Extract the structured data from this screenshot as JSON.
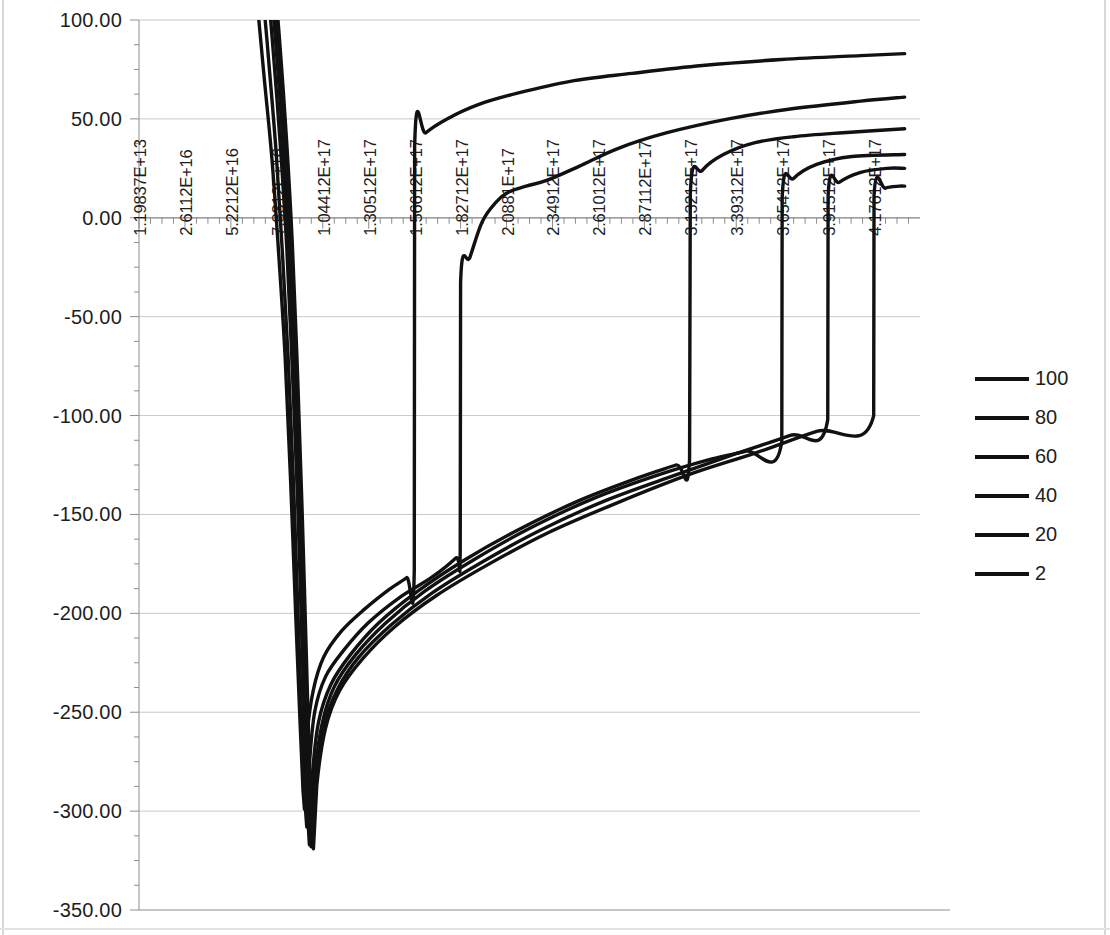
{
  "chart_data": {
    "type": "line",
    "title": "",
    "subtitle": "",
    "xlabel": "",
    "ylabel": "",
    "grid": true,
    "legend_position": "right",
    "ylim": [
      -350,
      100
    ],
    "y_ticks": [
      "100.00",
      "50.00",
      "0.00",
      "-50.00",
      "-100.00",
      "-150.00",
      "-200.00",
      "-250.00",
      "-300.00",
      "-350.00"
    ],
    "y_tick_values": [
      100,
      50,
      0,
      -50,
      -100,
      -150,
      -200,
      -250,
      -300,
      -350
    ],
    "x_tick_labels": [
      "1.19837E+13",
      "2.6112E+16",
      "5.2212E+16",
      "7.8312E+16",
      "1.04412E+17",
      "1.30512E+17",
      "1.56612E+17",
      "1.82712E+17",
      "2.0881E+17",
      "2.34912E+17",
      "2.61012E+17",
      "2.87112E+17",
      "3.13212E+17",
      "3.39312E+17",
      "3.65412E+17",
      "3.91512E+17",
      "4.17612E+17"
    ],
    "x_tick_values": [
      11983700000000.0,
      2.6112e+16,
      5.2212e+16,
      7.8312e+16,
      1.04412e+17,
      1.30512e+17,
      1.56612e+17,
      1.82712e+17,
      2.0881e+17,
      2.34912e+17,
      2.61012e+17,
      2.87112e+17,
      3.13212e+17,
      3.39312e+17,
      3.65412e+17,
      3.91512e+17,
      4.17612e+17
    ],
    "xlim": [
      0,
      4.4371e+17
    ],
    "minor_ticks_per_interval": 3,
    "series_color": "#111111",
    "legend": [
      {
        "label": "100"
      },
      {
        "label": "80"
      },
      {
        "label": "60"
      },
      {
        "label": "40"
      },
      {
        "label": "20"
      },
      {
        "label": "2"
      }
    ],
    "series": [
      {
        "name": "100",
        "points": [
          [
            5.8e+16,
            190
          ],
          [
            6.6e+16,
            120
          ],
          [
            7.1e+16,
            72
          ],
          [
            7.55e+16,
            30
          ],
          [
            7.95e+16,
            -20
          ],
          [
            8.3e+16,
            -70
          ],
          [
            8.6e+16,
            -130
          ],
          [
            8.9e+16,
            -200
          ],
          [
            9.15e+16,
            -255
          ],
          [
            9.32e+16,
            -290
          ],
          [
            9.4e+16,
            -299
          ],
          [
            9.55e+16,
            -262
          ],
          [
            9.9e+16,
            -239
          ],
          [
            1.05e+17,
            -222
          ],
          [
            1.15e+17,
            -209
          ],
          [
            1.28e+17,
            -198
          ],
          [
            1.42e+17,
            -188
          ],
          [
            1.52e+17,
            -182
          ],
          [
            1.564e+17,
            -178
          ],
          [
            1.566e+17,
            36
          ],
          [
            1.63e+17,
            43
          ],
          [
            1.75e+17,
            50
          ],
          [
            1.92e+17,
            57
          ],
          [
            2.15e+17,
            63
          ],
          [
            2.45e+17,
            69
          ],
          [
            2.8e+17,
            73
          ],
          [
            3.2e+17,
            77
          ],
          [
            3.65e+17,
            80
          ],
          [
            4.1e+17,
            82
          ],
          [
            4.35e+17,
            83
          ]
        ]
      },
      {
        "name": "80",
        "points": [
          [
            6.2e+16,
            190
          ],
          [
            6.95e+16,
            122
          ],
          [
            7.4e+16,
            76
          ],
          [
            7.8e+16,
            32
          ],
          [
            8.15e+16,
            -18
          ],
          [
            8.48e+16,
            -72
          ],
          [
            8.78e+16,
            -135
          ],
          [
            9.05e+16,
            -205
          ],
          [
            9.28e+16,
            -262
          ],
          [
            9.45e+16,
            -298
          ],
          [
            9.53e+16,
            -308
          ],
          [
            9.7e+16,
            -274
          ],
          [
            1e+17,
            -249
          ],
          [
            1.06e+17,
            -232
          ],
          [
            1.16e+17,
            -219
          ],
          [
            1.3e+17,
            -205
          ],
          [
            1.48e+17,
            -192
          ],
          [
            1.66e+17,
            -182
          ],
          [
            1.8e+17,
            -172
          ],
          [
            1.825e+17,
            -168
          ],
          [
            1.827e+17,
            -33
          ],
          [
            1.88e+17,
            -20
          ],
          [
            1.95e+17,
            -2
          ],
          [
            2.03e+17,
            8
          ],
          [
            2.1e+17,
            13
          ],
          [
            2.2e+17,
            16
          ],
          [
            2.32e+17,
            19
          ],
          [
            2.5e+17,
            26
          ],
          [
            2.72e+17,
            35
          ],
          [
            3e+17,
            43
          ],
          [
            3.35e+17,
            50
          ],
          [
            3.7e+17,
            55
          ],
          [
            4.1e+17,
            59
          ],
          [
            4.35e+17,
            61
          ]
        ]
      },
      {
        "name": "60",
        "points": [
          [
            6.55e+16,
            190
          ],
          [
            7.25e+16,
            124
          ],
          [
            7.68e+16,
            78
          ],
          [
            8.05e+16,
            34
          ],
          [
            8.4e+16,
            -16
          ],
          [
            8.7e+16,
            -74
          ],
          [
            9e+16,
            -140
          ],
          [
            9.25e+16,
            -212
          ],
          [
            9.45e+16,
            -268
          ],
          [
            9.6e+16,
            -305
          ],
          [
            9.68e+16,
            -317
          ],
          [
            9.85e+16,
            -282
          ],
          [
            1.02e+17,
            -255
          ],
          [
            1.09e+17,
            -236
          ],
          [
            1.2e+17,
            -221
          ],
          [
            1.36e+17,
            -205
          ],
          [
            1.58e+17,
            -189
          ],
          [
            1.85e+17,
            -173
          ],
          [
            2.15e+17,
            -158
          ],
          [
            2.5e+17,
            -143
          ],
          [
            2.85e+17,
            -131
          ],
          [
            3.05e+17,
            -125
          ],
          [
            3.128e+17,
            -122
          ],
          [
            3.132e+17,
            12
          ],
          [
            3.2e+17,
            24
          ],
          [
            3.32e+17,
            32
          ],
          [
            3.5e+17,
            38
          ],
          [
            3.72e+17,
            41
          ],
          [
            4e+17,
            43
          ],
          [
            4.35e+17,
            45
          ]
        ]
      },
      {
        "name": "40",
        "points": [
          [
            6.75e+16,
            190
          ],
          [
            7.42e+16,
            125
          ],
          [
            7.85e+16,
            79
          ],
          [
            8.2e+16,
            35
          ],
          [
            8.53e+16,
            -15
          ],
          [
            8.84e+16,
            -75
          ],
          [
            9.12e+16,
            -142
          ],
          [
            9.36e+16,
            -215
          ],
          [
            9.55e+16,
            -272
          ],
          [
            9.7e+16,
            -308
          ],
          [
            9.78e+16,
            -318
          ],
          [
            9.95e+16,
            -285
          ],
          [
            1.04e+17,
            -256
          ],
          [
            1.11e+17,
            -237
          ],
          [
            1.23e+17,
            -221
          ],
          [
            1.4e+17,
            -205
          ],
          [
            1.62e+17,
            -189
          ],
          [
            1.9e+17,
            -173
          ],
          [
            2.22e+17,
            -157
          ],
          [
            2.58e+17,
            -142
          ],
          [
            2.95e+17,
            -130
          ],
          [
            3.25e+17,
            -122
          ],
          [
            3.45e+17,
            -118
          ],
          [
            3.652e+17,
            -113
          ],
          [
            3.654e+17,
            10
          ],
          [
            3.72e+17,
            20
          ],
          [
            3.85e+17,
            27
          ],
          [
            4.05e+17,
            31
          ],
          [
            4.35e+17,
            32
          ]
        ]
      },
      {
        "name": "20",
        "points": [
          [
            6.9e+16,
            190
          ],
          [
            7.55e+16,
            126
          ],
          [
            7.97e+16,
            80
          ],
          [
            8.32e+16,
            36
          ],
          [
            8.63e+16,
            -14
          ],
          [
            8.93e+16,
            -76
          ],
          [
            9.2e+16,
            -144
          ],
          [
            9.44e+16,
            -217
          ],
          [
            9.62e+16,
            -274
          ],
          [
            9.77e+16,
            -310
          ],
          [
            9.85e+16,
            -318
          ],
          [
            1e+17,
            -286
          ],
          [
            1.05e+17,
            -257
          ],
          [
            1.13e+17,
            -238
          ],
          [
            1.25e+17,
            -222
          ],
          [
            1.43e+17,
            -206
          ],
          [
            1.66e+17,
            -190
          ],
          [
            1.95e+17,
            -174
          ],
          [
            2.28e+17,
            -158
          ],
          [
            2.65e+17,
            -143
          ],
          [
            3.05e+17,
            -130
          ],
          [
            3.4e+17,
            -119
          ],
          [
            3.7e+17,
            -110
          ],
          [
            3.913e+17,
            -102
          ],
          [
            3.915e+17,
            11
          ],
          [
            3.98e+17,
            18
          ],
          [
            4.1e+17,
            23
          ],
          [
            4.25e+17,
            25
          ],
          [
            4.35e+17,
            25
          ]
        ]
      },
      {
        "name": "2",
        "points": [
          [
            7.02e+16,
            190
          ],
          [
            7.65e+16,
            127
          ],
          [
            8.06e+16,
            81
          ],
          [
            8.4e+16,
            37
          ],
          [
            8.71e+16,
            -13
          ],
          [
            9e+16,
            -77
          ],
          [
            9.26e+16,
            -146
          ],
          [
            9.5e+16,
            -219
          ],
          [
            9.68e+16,
            -276
          ],
          [
            9.83e+16,
            -312
          ],
          [
            9.91e+16,
            -319
          ],
          [
            1.01e+17,
            -287
          ],
          [
            1.06e+17,
            -258
          ],
          [
            1.14e+17,
            -239
          ],
          [
            1.27e+17,
            -223
          ],
          [
            1.45e+17,
            -207
          ],
          [
            1.69e+17,
            -191
          ],
          [
            1.99e+17,
            -175
          ],
          [
            2.33e+17,
            -159
          ],
          [
            2.72e+17,
            -144
          ],
          [
            3.12e+17,
            -130
          ],
          [
            3.5e+17,
            -119
          ],
          [
            3.85e+17,
            -108
          ],
          [
            4.174e+17,
            -100
          ],
          [
            4.176e+17,
            11
          ],
          [
            4.24e+17,
            15
          ],
          [
            4.32e+17,
            16
          ],
          [
            4.35e+17,
            16
          ]
        ]
      }
    ]
  },
  "legend_title": ""
}
